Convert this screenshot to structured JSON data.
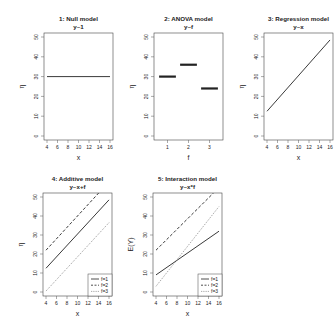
{
  "chart_data": [
    {
      "type": "line",
      "panel": 1,
      "title": "1: Null model",
      "subtitle": "y~1",
      "xlabel": "x",
      "ylabel": "η",
      "xlim": [
        4,
        16
      ],
      "ylim": [
        0,
        50
      ],
      "xticks": [
        4,
        6,
        8,
        10,
        12,
        14,
        16
      ],
      "yticks": [
        0,
        10,
        20,
        30,
        40,
        50
      ],
      "grid": false,
      "series": [
        {
          "name": "mean",
          "style": "solid",
          "x": [
            4,
            16
          ],
          "y": [
            30,
            30
          ]
        }
      ]
    },
    {
      "type": "line",
      "panel": 2,
      "title": "2: ANOVA model",
      "subtitle": "y~f",
      "xlabel": "f",
      "ylabel": "η",
      "xlim": [
        0.5,
        3.5
      ],
      "ylim": [
        0,
        50
      ],
      "xticks": [
        1,
        2,
        3
      ],
      "yticks": [
        0,
        10,
        20,
        30,
        40,
        50
      ],
      "grid": false,
      "categories": [
        "1",
        "2",
        "3"
      ],
      "values": [
        30,
        36,
        24
      ],
      "series": [
        {
          "name": "f=1",
          "style": "thick",
          "x": [
            0.6,
            1.4
          ],
          "y": [
            30,
            30
          ]
        },
        {
          "name": "f=2",
          "style": "thick",
          "x": [
            1.6,
            2.4
          ],
          "y": [
            36,
            36
          ]
        },
        {
          "name": "f=3",
          "style": "thick",
          "x": [
            2.6,
            3.4
          ],
          "y": [
            24,
            24
          ]
        }
      ]
    },
    {
      "type": "line",
      "panel": 3,
      "title": "3: Regression model",
      "subtitle": "y~x",
      "xlabel": "x",
      "ylabel": "η",
      "xlim": [
        4,
        16
      ],
      "ylim": [
        0,
        50
      ],
      "xticks": [
        4,
        6,
        8,
        10,
        12,
        14,
        16
      ],
      "yticks": [
        0,
        10,
        20,
        30,
        40,
        50
      ],
      "grid": false,
      "series": [
        {
          "name": "fit",
          "style": "solid",
          "x": [
            4,
            16
          ],
          "y": [
            12.5,
            48.5
          ]
        }
      ]
    },
    {
      "type": "line",
      "panel": 4,
      "title": "4: Additive model",
      "subtitle": "y~x+f",
      "xlabel": "x",
      "ylabel": "η",
      "xlim": [
        4,
        16
      ],
      "ylim": [
        0,
        50
      ],
      "xticks": [
        4,
        6,
        8,
        10,
        12,
        14,
        16
      ],
      "yticks": [
        0,
        10,
        20,
        30,
        40,
        50
      ],
      "grid": false,
      "legend": {
        "position": "bottomright",
        "entries": [
          "f=1",
          "f=2",
          "f=3"
        ]
      },
      "series": [
        {
          "name": "f=1",
          "style": "solid",
          "x": [
            4,
            16
          ],
          "y": [
            12.5,
            48.5
          ]
        },
        {
          "name": "f=2",
          "style": "dashed",
          "x": [
            4,
            16
          ],
          "y": [
            22,
            58
          ]
        },
        {
          "name": "f=3",
          "style": "dotted",
          "x": [
            4,
            16
          ],
          "y": [
            0.5,
            36.5
          ]
        }
      ]
    },
    {
      "type": "line",
      "panel": 5,
      "title": "5: Interaction model",
      "subtitle": "y~x*f",
      "xlabel": "x",
      "ylabel": "E(Y)",
      "xlim": [
        4,
        16
      ],
      "ylim": [
        0,
        50
      ],
      "xticks": [
        4,
        6,
        8,
        10,
        12,
        14,
        16
      ],
      "yticks": [
        0,
        10,
        20,
        30,
        40,
        50
      ],
      "grid": false,
      "legend": {
        "position": "bottomright",
        "entries": [
          "f=1",
          "f=2",
          "f=3"
        ]
      },
      "series": [
        {
          "name": "f=1",
          "style": "solid",
          "x": [
            4,
            16
          ],
          "y": [
            9,
            32
          ]
        },
        {
          "name": "f=2",
          "style": "dashed",
          "x": [
            4,
            16
          ],
          "y": [
            22,
            55
          ]
        },
        {
          "name": "f=3",
          "style": "dotted",
          "x": [
            4,
            16
          ],
          "y": [
            3,
            45
          ]
        }
      ]
    }
  ],
  "layout": {
    "panels": [
      {
        "box": [
          44,
          33,
          113,
          140
        ]
      },
      {
        "box": [
          154,
          33,
          223,
          140
        ]
      },
      {
        "box": [
          264,
          33,
          333,
          140
        ]
      },
      {
        "box": [
          43,
          193,
          112,
          296
        ]
      },
      {
        "box": [
          153,
          193,
          222,
          296
        ]
      }
    ],
    "colors": {
      "line": "#222222",
      "axis": "#555555",
      "box": "#444444"
    }
  }
}
